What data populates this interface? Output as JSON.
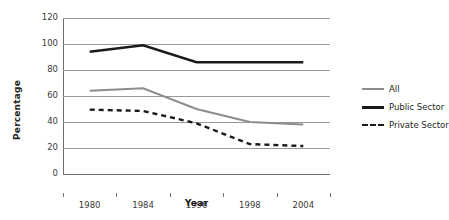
{
  "chart_data": {
    "type": "line",
    "title": "",
    "xlabel": "Year",
    "ylabel": "Percentage",
    "categories": [
      "1980",
      "1984",
      "1990",
      "1998",
      "2004"
    ],
    "ylim": [
      0,
      120
    ],
    "yticks": [
      0,
      20,
      40,
      60,
      80,
      100,
      120
    ],
    "grid": true,
    "legend_position": "right",
    "series": [
      {
        "name": "All",
        "values": [
          64,
          66,
          50,
          40,
          38
        ],
        "color": "#8c8c8c",
        "style": "solid"
      },
      {
        "name": "Public Sector",
        "values": [
          94,
          99,
          86,
          86,
          86
        ],
        "color": "#1a1a1a",
        "style": "solid"
      },
      {
        "name": "Private Sector",
        "values": [
          49.5,
          48.5,
          39,
          23,
          21.5
        ],
        "color": "#1a1a1a",
        "style": "dashed"
      }
    ]
  },
  "axes": {
    "y_title": "Percentage",
    "x_title": "Year",
    "y_tick_labels": [
      "120",
      "100",
      "80",
      "60",
      "40",
      "20",
      "0"
    ],
    "x_tick_labels": [
      "1980",
      "1984",
      "1990",
      "1998",
      "2004"
    ]
  },
  "legend": {
    "items": [
      {
        "label": "All"
      },
      {
        "label": "Public Sector"
      },
      {
        "label": "Private Sector"
      }
    ]
  }
}
